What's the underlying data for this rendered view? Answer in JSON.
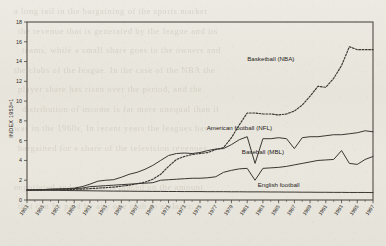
{
  "page": {
    "background_color": "#e9e6de",
    "ink_color": "#2e2b26",
    "showthrough_lines": [
      "a long tail in the bargaining of the sports market",
      "the revenue that is generated by the league and its",
      "teams, while a small share goes to the owners and",
      "the clubs of the league. In the case of the NBA the",
      "player share has risen over the period, and the",
      "distribution of income is far more unequal than it",
      "was in the 1960s. In recent years the leagues have",
      "bargained for a share of the television revenues",
      "",
      "negotiated and no limit is placed on the amount",
      "that can be paid by any one club to a player."
    ]
  },
  "chart_data": {
    "type": "line",
    "title": "",
    "subtitle": "",
    "xlabel": "",
    "ylabel": "INDEX 1953=1",
    "xlim": [
      1953,
      1997
    ],
    "ylim": [
      0,
      18
    ],
    "yticks": [
      0,
      2,
      4,
      6,
      8,
      10,
      12,
      14,
      16,
      18
    ],
    "ytick_labels": [
      "0",
      "2",
      "4",
      "6",
      "8",
      "10",
      "12",
      "14",
      "16",
      "18"
    ],
    "xticks": [
      1953,
      1955,
      1957,
      1959,
      1961,
      1963,
      1965,
      1967,
      1969,
      1971,
      1973,
      1975,
      1977,
      1979,
      1981,
      1983,
      1985,
      1987,
      1989,
      1991,
      1993,
      1995,
      1997
    ],
    "xtick_labels": [
      "1953",
      "1955",
      "1957",
      "1959",
      "1961",
      "1963",
      "1965",
      "1967",
      "1969",
      "1971",
      "1973",
      "1975",
      "1977",
      "1979",
      "1981",
      "1983",
      "1985",
      "1987",
      "1989",
      "1991",
      "1993",
      "1995",
      "1997"
    ],
    "xtick_rotation": -55,
    "minor_xticks_every": 1,
    "grid": false,
    "legend_position": "inline-annotations",
    "x": [
      1953,
      1954,
      1955,
      1956,
      1957,
      1958,
      1959,
      1960,
      1961,
      1962,
      1963,
      1964,
      1965,
      1966,
      1967,
      1968,
      1969,
      1970,
      1971,
      1972,
      1973,
      1974,
      1975,
      1976,
      1977,
      1978,
      1979,
      1980,
      1981,
      1982,
      1983,
      1984,
      1985,
      1986,
      1987,
      1988,
      1989,
      1990,
      1991,
      1992,
      1993,
      1994,
      1995,
      1996,
      1997
    ],
    "series": [
      {
        "name": "Basketball (NBA)",
        "style": "dotted",
        "label_x": 1984,
        "label_y": 14.1,
        "values": [
          1.0,
          1.0,
          1.0,
          1.02,
          1.05,
          1.05,
          1.08,
          1.1,
          1.15,
          1.2,
          1.25,
          1.3,
          1.4,
          1.5,
          1.65,
          1.8,
          2.1,
          2.6,
          3.4,
          4.1,
          4.4,
          4.6,
          4.7,
          4.8,
          5.1,
          5.3,
          6.3,
          7.6,
          8.8,
          8.8,
          8.7,
          8.7,
          8.6,
          8.7,
          9.0,
          9.6,
          10.5,
          11.5,
          11.4,
          12.3,
          13.6,
          15.5,
          15.2,
          15.2,
          15.2
        ]
      },
      {
        "name": "American football (NFL)",
        "style": "solid",
        "label_x": 1980,
        "label_y": 7.05,
        "values": [
          1.0,
          1.02,
          1.05,
          1.1,
          1.12,
          1.15,
          1.2,
          1.35,
          1.6,
          1.9,
          2.0,
          2.05,
          2.3,
          2.6,
          2.8,
          3.1,
          3.5,
          4.0,
          4.5,
          4.7,
          4.75,
          4.7,
          4.8,
          5.0,
          5.15,
          5.2,
          5.6,
          6.1,
          6.4,
          3.7,
          6.2,
          6.2,
          6.3,
          6.2,
          5.2,
          6.3,
          6.4,
          6.4,
          6.5,
          6.6,
          6.6,
          6.7,
          6.8,
          7.0,
          6.9
        ]
      },
      {
        "name": "Baseball (MBL)",
        "style": "solid",
        "label_x": 1983,
        "label_y": 4.65,
        "values": [
          1.0,
          1.02,
          1.05,
          1.08,
          1.1,
          1.12,
          1.15,
          1.2,
          1.35,
          1.4,
          1.45,
          1.5,
          1.55,
          1.6,
          1.65,
          1.7,
          1.75,
          2.0,
          2.05,
          2.1,
          2.15,
          2.2,
          2.2,
          2.25,
          2.35,
          2.8,
          3.0,
          3.15,
          3.2,
          2.0,
          3.2,
          3.25,
          3.3,
          3.4,
          3.55,
          3.7,
          3.85,
          4.0,
          4.05,
          4.1,
          5.0,
          3.7,
          3.6,
          4.1,
          4.4
        ]
      },
      {
        "name": "English football",
        "style": "solid",
        "label_x": 1985,
        "label_y": 1.35,
        "values": [
          1.0,
          1.0,
          0.99,
          0.98,
          0.97,
          0.96,
          0.95,
          0.94,
          0.93,
          0.92,
          0.91,
          0.9,
          0.9,
          0.89,
          0.88,
          0.88,
          0.87,
          0.87,
          0.86,
          0.86,
          0.85,
          0.85,
          0.85,
          0.84,
          0.84,
          0.84,
          0.83,
          0.83,
          0.82,
          0.82,
          0.82,
          0.81,
          0.81,
          0.8,
          0.8,
          0.79,
          0.79,
          0.78,
          0.78,
          0.77,
          0.77,
          0.76,
          0.76,
          0.76,
          0.75
        ]
      }
    ]
  }
}
